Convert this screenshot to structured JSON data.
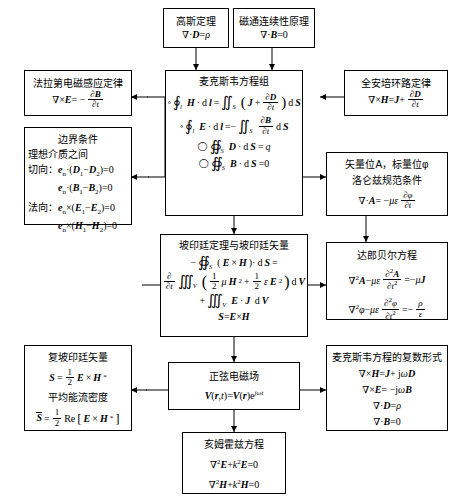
{
  "diagram": {
    "boxes": {
      "gauss": {
        "name": "高斯定理",
        "eq1": "∇·D = ρ"
      },
      "flux_continuity": {
        "name": "磁通连续性原理",
        "eq1": "∇·B = 0"
      },
      "faraday": {
        "name": "法拉第电磁感应定律",
        "eq1": "∇×E = − ∂B/∂t"
      },
      "ampere": {
        "name": "全安培环路定律",
        "eq1": "∇×H = J + ∂D/∂t"
      },
      "maxwell": {
        "name": "麦克斯韦方程组",
        "eq1": "∮l H·dl = ∬S ( J + ∂D/∂t ) dS",
        "eq2": "∮l E·dl = −∬S ∂B/∂t dS",
        "eq3": "∯S D·dS = q",
        "eq4": "∯S B·dS = 0"
      },
      "boundary": {
        "name": "边界条件",
        "sub": "理想介质之间",
        "line1": "切向： eₙ·(D₁−D₂)=0",
        "line2": "eₙ·(B₁−B₂)=0",
        "line3": "法向： eₙ×(E₁−E₂)=0",
        "line4": "eₙ×(H₁−H₂)=0"
      },
      "potentials": {
        "name": "矢量位A，标量位φ",
        "sub": "洛仑兹规范条件",
        "eq1": "∇·A = −με ∂φ/∂t"
      },
      "dalembert": {
        "name": "达郎贝尔方程",
        "eq1": "∇²A − με ∂²A/∂t² = −μJ",
        "eq2": "∇²φ − με ∂²φ/∂t² = −ρ/ε"
      },
      "poynting": {
        "name": "坡印廷定理与坡印廷矢量",
        "eq1": "−∯S (E×H)·dS =",
        "eq2": "∂/∂t ∭V ( ½μH² + ½εE² ) dV",
        "eq3": "+ ∭V E·J dV",
        "eq4": "S = E×H"
      },
      "complex_poynting": {
        "name": "复坡印廷矢量",
        "eq1": "S = ½ E×H*",
        "sub": "平均能流密度",
        "eq2": "S̄ = ½ Re[E×H*]"
      },
      "sinusoidal": {
        "name": "正弦电磁场",
        "eq1": "V(r,t) = V(r)e^{jωt}"
      },
      "maxwell_complex": {
        "name": "麦克斯韦方程的复数形式",
        "eq1": "∇×H = J + jωD",
        "eq2": "∇×E = −jωB",
        "eq3": "∇·D = ρ",
        "eq4": "∇·B = 0"
      },
      "helmholtz": {
        "name": "亥姆霍兹方程",
        "eq1": "∇²E + k²E = 0",
        "eq2": "∇²H + k²H = 0"
      }
    },
    "colors": {
      "line": "#000000",
      "background": "#ffffff",
      "box_border": "#000000"
    }
  }
}
